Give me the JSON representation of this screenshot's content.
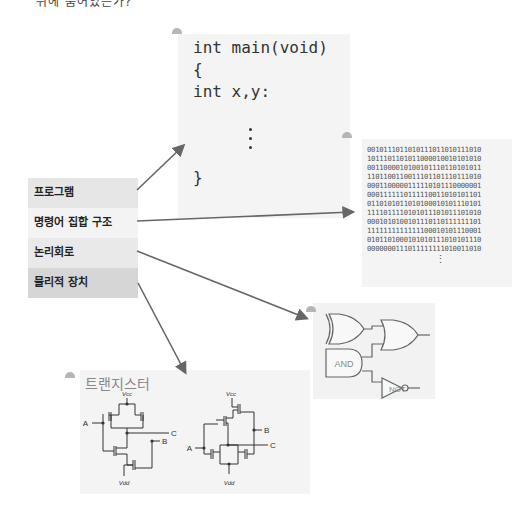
{
  "header": {
    "partial_text": "뒤에 숨어있는가?"
  },
  "code_panel": {
    "lines": [
      "int main(void)",
      "{",
      "int x,y:",
      "}"
    ]
  },
  "binary_panel": {
    "lines": [
      "0010111011010111011010111010",
      "1011101101011000010010101010",
      "0011000010100101110110101011",
      "1101100110011101101110111010",
      "0001100000111110101110000001",
      "0001111110111110011010101101",
      "0110101011010100010101110101",
      "1111011110101011101011101010",
      "0001010100101110110111111101",
      "1111111111111100010101110001",
      "0101101000101010111010101110",
      "0000000111011111111010011010"
    ],
    "continuation": "⋮"
  },
  "layers": [
    {
      "label": "프로그램",
      "color": "#e6e6e6"
    },
    {
      "label": "명령어 집합 구조",
      "color": "#f3f3f3"
    },
    {
      "label": "논리회로",
      "color": "#e9e9e9"
    },
    {
      "label": "물리적 장치",
      "color": "#d6d6d6"
    }
  ],
  "logic_gates": {
    "and_label": "AND",
    "not_label": "NOT"
  },
  "transistor_panel": {
    "title": "트랜지스터",
    "labels": {
      "vcc": "Vcc",
      "vdd": "Vdd",
      "a": "A",
      "b": "B",
      "c": "C"
    }
  },
  "colors": {
    "arrow": "#666666",
    "panel_bg": "#f4f4f4",
    "bullet": "#b5b5b5"
  }
}
